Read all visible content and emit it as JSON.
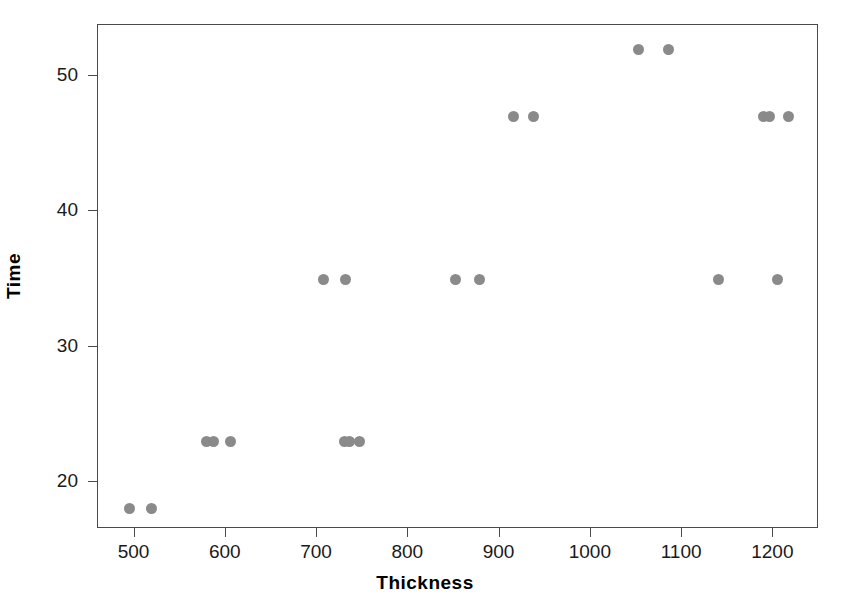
{
  "chart_data": {
    "type": "scatter",
    "title": "",
    "xlabel": "Thickness",
    "ylabel": "Time",
    "xlim": [
      460,
      1250
    ],
    "ylim": [
      16.5,
      53.8
    ],
    "xticks": [
      500,
      600,
      700,
      800,
      900,
      1000,
      1100,
      1200
    ],
    "yticks": [
      20,
      30,
      40,
      50
    ],
    "xtick_labels": [
      "500",
      "600",
      "700",
      "800",
      "900",
      "1000",
      "1100",
      "1200"
    ],
    "ytick_labels": [
      "20",
      "30",
      "40",
      "50"
    ],
    "grid": false,
    "legend": null,
    "marker": {
      "shape": "circle",
      "color": "#8a8a8a",
      "size": 11
    },
    "points": [
      {
        "x": 495,
        "y": 18
      },
      {
        "x": 519,
        "y": 18
      },
      {
        "x": 579,
        "y": 23
      },
      {
        "x": 587,
        "y": 23
      },
      {
        "x": 605,
        "y": 23
      },
      {
        "x": 707,
        "y": 35
      },
      {
        "x": 730,
        "y": 23
      },
      {
        "x": 731,
        "y": 35
      },
      {
        "x": 736,
        "y": 23
      },
      {
        "x": 747,
        "y": 23
      },
      {
        "x": 852,
        "y": 35
      },
      {
        "x": 878,
        "y": 35
      },
      {
        "x": 915,
        "y": 47
      },
      {
        "x": 937,
        "y": 47
      },
      {
        "x": 1052,
        "y": 52
      },
      {
        "x": 1085,
        "y": 52
      },
      {
        "x": 1140,
        "y": 35
      },
      {
        "x": 1189,
        "y": 47
      },
      {
        "x": 1196,
        "y": 47
      },
      {
        "x": 1205,
        "y": 35
      },
      {
        "x": 1217,
        "y": 47
      }
    ]
  },
  "axes": {
    "x_title": "Thickness",
    "y_title": "Time"
  },
  "colors": {
    "marker": "#8a8a8a",
    "frame": "#4a4a4a",
    "text": "#1a1a1a",
    "background": "#ffffff"
  }
}
